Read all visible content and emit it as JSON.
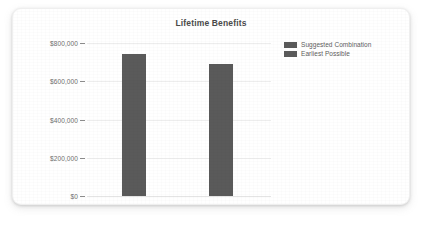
{
  "card": {
    "background_color": "#ffffff"
  },
  "chart_data": {
    "type": "bar",
    "title": "Lifetime Benefits",
    "xlabel": "",
    "ylabel": "",
    "categories": [
      "Suggested Combination",
      "Earliest Possible"
    ],
    "values": [
      745000,
      690000
    ],
    "ylim": [
      0,
      800000
    ],
    "yticks": [
      0,
      200000,
      400000,
      600000,
      800000
    ],
    "ytick_labels": [
      "$0",
      "$200,000",
      "$400,000",
      "$600,000",
      "$800,000"
    ],
    "grid": true,
    "legend_position": "right",
    "series": [
      {
        "name": "Suggested Combination",
        "value": 745000,
        "color": "#5a5a5a"
      },
      {
        "name": "Earliest Possible",
        "value": 690000,
        "color": "#5a5a5a"
      }
    ]
  },
  "legend": {
    "items": [
      {
        "label": "Suggested Combination",
        "color": "#5a5a5a"
      },
      {
        "label": "Earliest Possible",
        "color": "#5a5a5a"
      }
    ]
  },
  "axis": {
    "ticks": [
      {
        "label": "$800,000",
        "value": 800000
      },
      {
        "label": "$600,000",
        "value": 600000
      },
      {
        "label": "$400,000",
        "value": 400000
      },
      {
        "label": "$200,000",
        "value": 200000
      },
      {
        "label": "$0",
        "value": 0
      }
    ]
  }
}
